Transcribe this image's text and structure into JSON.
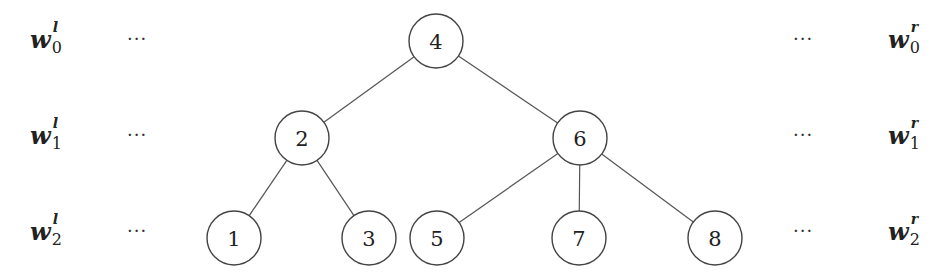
{
  "diagram": {
    "type": "binary-search-tree",
    "nodes": [
      {
        "id": "4",
        "label": "4",
        "cx": 436,
        "cy": 41
      },
      {
        "id": "2",
        "label": "2",
        "cx": 302,
        "cy": 138
      },
      {
        "id": "6",
        "label": "6",
        "cx": 580,
        "cy": 138
      },
      {
        "id": "1",
        "label": "1",
        "cx": 234,
        "cy": 238
      },
      {
        "id": "3",
        "label": "3",
        "cx": 369,
        "cy": 238
      },
      {
        "id": "5",
        "label": "5",
        "cx": 437,
        "cy": 238
      },
      {
        "id": "7",
        "label": "7",
        "cx": 579,
        "cy": 238
      },
      {
        "id": "8",
        "label": "8",
        "cx": 715,
        "cy": 238
      }
    ],
    "edges": [
      [
        "4",
        "2"
      ],
      [
        "4",
        "6"
      ],
      [
        "2",
        "1"
      ],
      [
        "2",
        "3"
      ],
      [
        "6",
        "5"
      ],
      [
        "6",
        "7"
      ],
      [
        "6",
        "8"
      ]
    ],
    "node_radius": 27
  },
  "left_labels": [
    {
      "base": "w",
      "sup": "l",
      "sub": "0"
    },
    {
      "base": "w",
      "sup": "l",
      "sub": "1"
    },
    {
      "base": "w",
      "sup": "l",
      "sub": "2"
    }
  ],
  "right_labels": [
    {
      "base": "w",
      "sup": "r",
      "sub": "0"
    },
    {
      "base": "w",
      "sup": "r",
      "sub": "1"
    },
    {
      "base": "w",
      "sup": "r",
      "sub": "2"
    }
  ],
  "ellipsis": "···",
  "colors": {
    "stroke": "#444444",
    "text": "#222222",
    "background": "#ffffff"
  }
}
